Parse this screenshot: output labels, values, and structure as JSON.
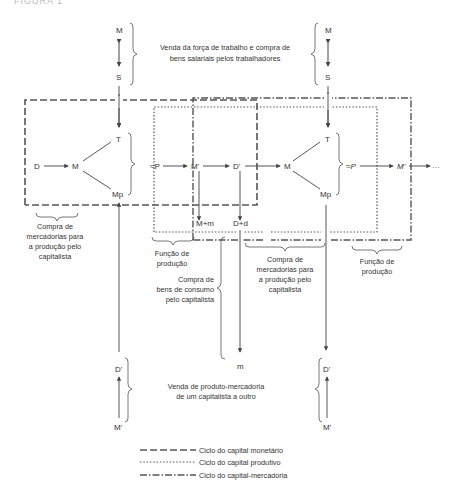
{
  "figure_label": "FIGURA 1",
  "top_section": {
    "left_pair": {
      "top": "M",
      "bottom": "S"
    },
    "right_pair": {
      "top": "M",
      "bottom": "S"
    },
    "caption_line1": "Venda da força de trabalho e compra de",
    "caption_line2": "bens salariais pelos trabalhadores"
  },
  "main_row": {
    "n1": "D",
    "n2": "M",
    "n3_top": "T",
    "n3_bottom": "Mp",
    "n4": "≈P",
    "n5": "M'",
    "n6": "D'",
    "n7": "M",
    "n8_top": "T",
    "n8_bottom": "Mp",
    "n9": "≈P",
    "n10": "M'",
    "tail": "…"
  },
  "sub_nodes": {
    "mm": "M+m",
    "dd": "D+d",
    "m": "m"
  },
  "captions": {
    "compra1": [
      "Compra de",
      "mercadorias para",
      "a produção pelo",
      "capitalista"
    ],
    "funcao1": [
      "Função de",
      "produção"
    ],
    "consumo": [
      "Compra de",
      "bens de consumo",
      "pelo capitalista"
    ],
    "compra2": [
      "Compra de",
      "mercadorias para",
      "a produção pelo",
      "capitalista"
    ],
    "funcao2": [
      "Função de",
      "produção"
    ]
  },
  "bottom_section": {
    "left_pair": {
      "top": "D'",
      "bottom": "M'"
    },
    "right_pair": {
      "top": "D'",
      "bottom": "M'"
    },
    "caption_line1": "Venda de produto-mercadoria",
    "caption_line2": "de um capitalista a outro"
  },
  "legend": [
    {
      "style": "dashed",
      "label": "Ciclo do capital monetário"
    },
    {
      "style": "dotted",
      "label": "Ciclo do capital produtivo"
    },
    {
      "style": "dash-dot",
      "label": "Ciclo do capital-mercadoria"
    }
  ],
  "colors": {
    "line": "#555555",
    "text": "#333333"
  }
}
